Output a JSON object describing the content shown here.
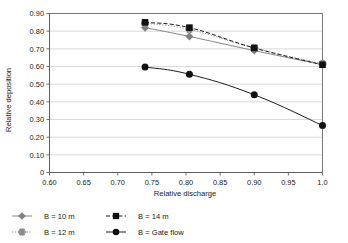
{
  "chart_data": {
    "type": "line",
    "title": "",
    "xlabel": "Relative discharge",
    "ylabel": "Relative deposition",
    "xlim": [
      0.6,
      1.0
    ],
    "ylim": [
      0.0,
      0.9
    ],
    "grid": "horizontal",
    "legend_position": "bottom",
    "x_ticks": [
      0.6,
      0.65,
      0.7,
      0.75,
      0.8,
      0.85,
      0.9,
      0.95,
      1.0
    ],
    "x_tick_labels": [
      "0.60",
      "0.65",
      "0.70",
      "0.75",
      "0.80",
      "0.85",
      "0.90",
      "0.95",
      "1.0"
    ],
    "y_ticks": [
      0.0,
      0.1,
      0.2,
      0.3,
      0.4,
      0.5,
      0.6,
      0.7,
      0.8,
      0.9
    ],
    "y_tick_labels": [
      "0",
      "0.10",
      "0.20",
      "0.30",
      "0.40",
      "0.50",
      "0.60",
      "0.70",
      "0.80",
      "0.90"
    ],
    "x": [
      0.74,
      0.805,
      0.9,
      1.0
    ],
    "series": [
      {
        "name": "B = 10 m",
        "values": [
          0.82,
          0.77,
          0.69,
          0.61
        ],
        "marker": "diamond",
        "color": "#808080",
        "line_style": "solid"
      },
      {
        "name": "B = 12 m",
        "values": [
          0.845,
          0.81,
          0.705,
          0.615
        ],
        "marker": "star",
        "color": "#8c8c8c",
        "line_style": "dotted"
      },
      {
        "name": "B = 14 m",
        "values": [
          0.85,
          0.82,
          0.705,
          0.61
        ],
        "marker": "square",
        "color": "#111111",
        "line_style": "dashed"
      },
      {
        "name": "B = Gate flow",
        "values": [
          0.597,
          0.556,
          0.44,
          0.266
        ],
        "marker": "circle",
        "color": "#111111",
        "line_style": "solid"
      }
    ]
  },
  "legend": {
    "entries": [
      {
        "label": "B = 10 m"
      },
      {
        "label": "B = 14 m"
      },
      {
        "label": "B = 12 m"
      },
      {
        "label": "B = Gate flow"
      }
    ]
  }
}
